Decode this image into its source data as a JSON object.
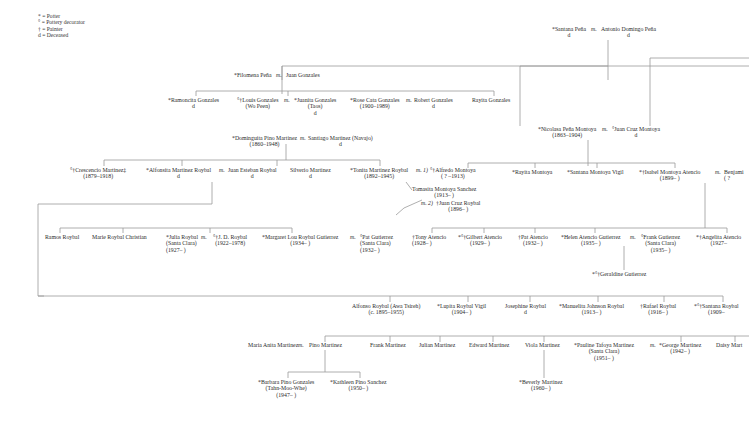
{
  "legend": [
    {
      "symbol": "*",
      "meaning": "= Potter"
    },
    {
      "symbol": "°",
      "meaning": "= Pottery decorator"
    },
    {
      "symbol": "†",
      "meaning": "= Painter"
    },
    {
      "symbol": "d",
      "meaning": "= Deceased"
    }
  ],
  "marriage_label": "m.",
  "gen1": {
    "santana_pena": {
      "name": "*Santana Peña",
      "sub": "d"
    },
    "antonio_domingo_pena": {
      "name": "Antonio Domingo Peña",
      "sub": "d"
    }
  },
  "gen2": {
    "filomena_pena": {
      "name": "*Filomena Peña"
    },
    "juan_gonzales": {
      "name": "Juan Gonzales"
    },
    "nicolasa_pena_montoya": {
      "name": "*Nicolasa Peña Montoya",
      "sub": "(1863–1904)"
    },
    "juan_cruz_montoya": {
      "name": "°Juan Cruz Montoya",
      "sub": "d"
    }
  },
  "gonzales_children": [
    {
      "name": "*Ramoncita Gonzales",
      "sub": "d"
    },
    {
      "name": "°†Louis Gonzales",
      "sub": "(Wo Peen)"
    },
    {
      "name": "*Juanita Gonzales",
      "sub": "(Taos)",
      "sub2": "d"
    },
    {
      "name": "*Rose Cata Gonzales",
      "sub": "(1900–1989)"
    },
    {
      "name": "Robert Gonzales",
      "sub": "d"
    },
    {
      "name": "Rayita Gonzales"
    }
  ],
  "martinez_parents": {
    "dominguita": {
      "name": "*Dominguita Pino Martinez",
      "sub": "(1860–1948)"
    },
    "santiago": {
      "name": "Santiago Martinez (Navajo)",
      "sub": "d"
    }
  },
  "martinez_children": [
    {
      "name": "°†Crescencio Martinez‡",
      "sub": "(1879–1918)"
    },
    {
      "name": "*Alfonsita Martinez Roybal",
      "sub": "d"
    },
    {
      "name": "Juan Esteban Roybal",
      "sub": "d"
    },
    {
      "name": "Silverio Martinez",
      "sub": "d"
    },
    {
      "name": "*Tonita Martinez Roybal",
      "sub": "(1892–1945)"
    }
  ],
  "tonita_spouses": {
    "first_prefix": "m. 1)",
    "first": {
      "name": "°†Alfredo Montoya",
      "sub": "( ? –1913)"
    },
    "tomasita": {
      "name": "Tomasita Montoya Sanchez",
      "sub": "(1913–      )"
    },
    "second_prefix": "m. 2)",
    "second": {
      "name": "†Juan Cruz Roybal",
      "sub": "(1896–      )"
    }
  },
  "montoya_children": [
    {
      "name": "*Rayita Montoya"
    },
    {
      "name": "*Santana Montoya Vigil"
    },
    {
      "name": "*†Isabel Montoya Atencio",
      "sub": "(1899–      )"
    },
    {
      "name": "Benjami",
      "sub": "( ?"
    }
  ],
  "roybal_children": [
    {
      "name": "Ramos Roybal"
    },
    {
      "name": "Marie Roybal Christian"
    },
    {
      "name": "*Julia Roybal",
      "sub": "(Santa Clara)",
      "sub2": "(1927–      )"
    },
    {
      "name": "°†J. D. Roybal",
      "sub": "(1922–1978)"
    },
    {
      "name": "*Margaret Lou Roybal Gutierrez",
      "sub": "(1934–      )"
    },
    {
      "name": "°Pat Gutierrez",
      "sub": "(Santa Clara)",
      "sub2": "(1932–      )"
    }
  ],
  "atencio_children": [
    {
      "name": "†Tony Atencio",
      "sub": "(1928–      )"
    },
    {
      "name": "*°†Gilbert Atencio",
      "sub": "(1929–      )"
    },
    {
      "name": "†Pat Atencio",
      "sub": "(1932–      )"
    },
    {
      "name": "*Helen Atencio Gutierrez",
      "sub": "(1935–      )"
    },
    {
      "name": "°Frank Gutierrez",
      "sub": "(Santa Clara)",
      "sub2": "(1935–      )"
    },
    {
      "name": "*†Angelita Atencio",
      "sub": "(1927–"
    }
  ],
  "geraldine": {
    "name": "*°†Geraldine Gutierrez"
  },
  "alfonsita_children": [
    {
      "name": "Alfonso Roybal (Awa Tsireh)",
      "sub": "(c. 1895–1955)"
    },
    {
      "name": "*Lupita Roybal Vigil",
      "sub": "(1904–      )"
    },
    {
      "name": "Josephine Roybal",
      "sub": "d"
    },
    {
      "name": "*Manuelita Johnson Roybal",
      "sub": "(1913–      )"
    },
    {
      "name": "†Rafael Roybal",
      "sub": "(1916–      )"
    },
    {
      "name": "*°†Santana Roybal",
      "sub": "(1909–"
    }
  ],
  "maria_anita": {
    "name": "Maria Anita Martinez"
  },
  "pino_children": [
    {
      "name": "Pino Martinez"
    },
    {
      "name": "Frank Martinez"
    },
    {
      "name": "Julian Martinez"
    },
    {
      "name": "Edward Martinez"
    },
    {
      "name": "Viola Martinez"
    },
    {
      "name": "*Pauline Tafoya Martinez",
      "sub": "(Santa Clara)",
      "sub2": "(1951–      )"
    },
    {
      "name": "*George Martinez",
      "sub": "(1942–      )"
    },
    {
      "name": "Daisy Mart"
    }
  ],
  "grandchildren": [
    {
      "name": "*Barbara Pino Gonzales",
      "sub": "(Tahn-Moo-Whe)",
      "sub2": "(1947–      )"
    },
    {
      "name": "*Kathleen Pino Sanchez",
      "sub": "(1950–      )"
    },
    {
      "name": "*Beverly Martinez",
      "sub": "(1960–      )"
    }
  ]
}
